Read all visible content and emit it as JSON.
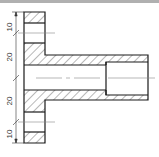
{
  "drawing": {
    "type": "section-view",
    "description": "Flanged bushing cross-section with hatching",
    "colors": {
      "outline": "#1a1a1a",
      "hatch": "#333333",
      "centerline": "#888888",
      "dimension": "#333333",
      "topbar": "#b0b0b0"
    },
    "dimensions": [
      {
        "id": "dim-top",
        "label": "10"
      },
      {
        "id": "dim-upper-mid",
        "label": "20"
      },
      {
        "id": "dim-lower-mid",
        "label": "20"
      },
      {
        "id": "dim-bottom",
        "label": "10"
      }
    ]
  }
}
